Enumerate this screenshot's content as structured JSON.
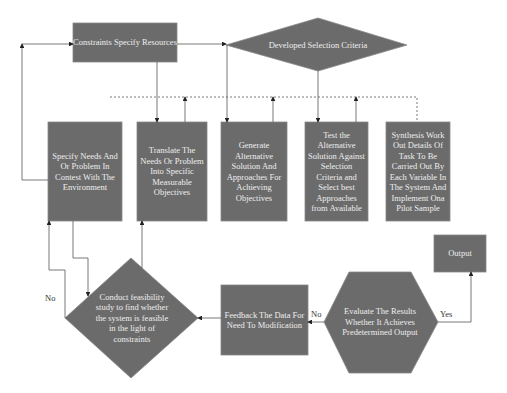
{
  "nodes": {
    "constraints": "Constraints Specify Resources",
    "criteria": "Developed Selection Criteria",
    "specify": "Specify Needs And Or Problem In Contest With The Environment",
    "translate": "Translate The Needs Or Problem Into Specific Measurable Objectives",
    "generate": "Generate Alternative Solution And Approaches For Achieving Objectives",
    "test": "Test the Alternative Solution Against Selection Criteria and Select best Approaches from Available",
    "synthesis": "Synthesis Work Out Details Of Task To Be Carried Out By Each Variable In The System And Implement Ona Pilot Sample",
    "feasibility": "Conduct feasibility study to find whether the system is feasible in the light of constraints",
    "feedback": "Feedback The Data For Need To Modification",
    "evaluate": "Evaluate The Results Whether It Achieves Predetermined Output",
    "output": "Output"
  },
  "edges": {
    "no_left": "No",
    "no_mid": "No",
    "yes": "Yes"
  },
  "colors": {
    "fill": "#6b6b6b",
    "line": "#555555"
  }
}
